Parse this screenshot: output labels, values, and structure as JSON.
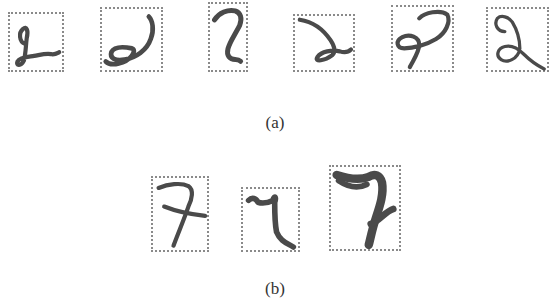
{
  "figure": {
    "subfigures": [
      {
        "label": "(a)",
        "description": "Handwritten digit 2 samples with bounding boxes",
        "samples": [
          {
            "id": "a1",
            "digit": "2",
            "box": {
              "x": 8,
              "y": 12,
              "w": 56,
              "h": 60
            }
          },
          {
            "id": "a2",
            "digit": "2",
            "box": {
              "x": 100,
              "y": 7,
              "w": 63,
              "h": 65
            }
          },
          {
            "id": "a3",
            "digit": "2",
            "box": {
              "x": 208,
              "y": 2,
              "w": 40,
              "h": 70
            }
          },
          {
            "id": "a4",
            "digit": "2",
            "box": {
              "x": 293,
              "y": 14,
              "w": 62,
              "h": 58
            }
          },
          {
            "id": "a5",
            "digit": "2",
            "box": {
              "x": 391,
              "y": 5,
              "w": 63,
              "h": 67
            }
          },
          {
            "id": "a6",
            "digit": "2",
            "box": {
              "x": 486,
              "y": 7,
              "w": 63,
              "h": 65
            }
          }
        ]
      },
      {
        "label": "(b)",
        "description": "Handwritten digit 7 samples with bounding boxes",
        "samples": [
          {
            "id": "b1",
            "digit": "7",
            "box": {
              "x": 151,
              "y": 176,
              "w": 58,
              "h": 76
            }
          },
          {
            "id": "b2",
            "digit": "7",
            "box": {
              "x": 241,
              "y": 187,
              "w": 59,
              "h": 65
            }
          },
          {
            "id": "b3",
            "digit": "7",
            "box": {
              "x": 329,
              "y": 165,
              "w": 72,
              "h": 86
            }
          }
        ]
      }
    ],
    "colors": {
      "stroke": "#4a4a4a",
      "box_border": "#8a8a8a",
      "background": "#ffffff"
    }
  }
}
